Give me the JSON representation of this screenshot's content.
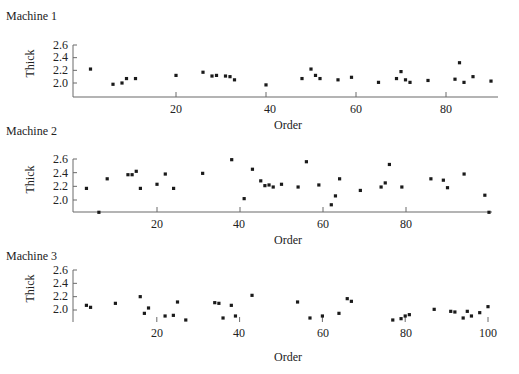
{
  "chart_data": [
    {
      "type": "scatter",
      "title": "Machine 1",
      "xlabel": "Order",
      "ylabel": "Thick",
      "yticks": [
        "2.6",
        "2.4",
        "2.2",
        "2.0"
      ],
      "xticks": [
        "20",
        "40",
        "60",
        "80"
      ],
      "xlim": [
        0,
        91
      ],
      "ylim": [
        1.8,
        2.6
      ],
      "grid": false,
      "points": [
        [
          1,
          2.22
        ],
        [
          6,
          1.98
        ],
        [
          8,
          2.0
        ],
        [
          9,
          2.07
        ],
        [
          11,
          2.07
        ],
        [
          20,
          2.12
        ],
        [
          26,
          2.17
        ],
        [
          28,
          2.11
        ],
        [
          29,
          2.12
        ],
        [
          31,
          2.11
        ],
        [
          32,
          2.1
        ],
        [
          33,
          2.05
        ],
        [
          40,
          1.97
        ],
        [
          48,
          2.07
        ],
        [
          50,
          2.22
        ],
        [
          51,
          2.12
        ],
        [
          52,
          2.07
        ],
        [
          56,
          2.05
        ],
        [
          59,
          2.09
        ],
        [
          65,
          2.01
        ],
        [
          69,
          2.07
        ],
        [
          70,
          2.18
        ],
        [
          71,
          2.05
        ],
        [
          72,
          2.01
        ],
        [
          76,
          2.04
        ],
        [
          82,
          2.06
        ],
        [
          83,
          2.32
        ],
        [
          84,
          2.01
        ],
        [
          86,
          2.1
        ],
        [
          90,
          2.03
        ]
      ]
    },
    {
      "type": "scatter",
      "title": "Machine 2",
      "xlabel": "Order",
      "ylabel": "Thick",
      "yticks": [
        "2.6",
        "2.4",
        "2.2",
        "2.0"
      ],
      "xticks": [
        "20",
        "40",
        "60",
        "80"
      ],
      "xlim": [
        0,
        100
      ],
      "ylim": [
        1.8,
        2.6
      ],
      "grid": false,
      "points": [
        [
          3,
          2.17
        ],
        [
          6,
          1.82
        ],
        [
          8,
          2.31
        ],
        [
          13,
          2.37
        ],
        [
          14,
          2.37
        ],
        [
          15,
          2.42
        ],
        [
          16,
          2.17
        ],
        [
          20,
          2.23
        ],
        [
          22,
          2.38
        ],
        [
          24,
          2.17
        ],
        [
          31,
          2.39
        ],
        [
          38,
          2.59
        ],
        [
          41,
          2.02
        ],
        [
          43,
          2.45
        ],
        [
          45,
          2.28
        ],
        [
          46,
          2.21
        ],
        [
          47,
          2.22
        ],
        [
          48,
          2.19
        ],
        [
          50,
          2.23
        ],
        [
          54,
          2.19
        ],
        [
          56,
          2.56
        ],
        [
          59,
          2.22
        ],
        [
          62,
          1.93
        ],
        [
          63,
          2.06
        ],
        [
          64,
          2.31
        ],
        [
          69,
          2.14
        ],
        [
          74,
          2.19
        ],
        [
          75,
          2.25
        ],
        [
          76,
          2.52
        ],
        [
          79,
          2.19
        ],
        [
          86,
          2.31
        ],
        [
          89,
          2.29
        ],
        [
          90,
          2.18
        ],
        [
          94,
          2.38
        ],
        [
          99,
          2.07
        ],
        [
          100,
          1.82
        ]
      ]
    },
    {
      "type": "scatter",
      "title": "Machine 3",
      "xlabel": "Order",
      "ylabel": "Thick",
      "yticks": [
        "2.6",
        "2.4",
        "2.2",
        "2.0"
      ],
      "xticks": [
        "20",
        "40",
        "60",
        "80",
        "100"
      ],
      "xlim": [
        0,
        100
      ],
      "ylim": [
        1.8,
        2.6
      ],
      "grid": false,
      "points": [
        [
          3,
          2.07
        ],
        [
          4,
          2.04
        ],
        [
          10,
          2.1
        ],
        [
          16,
          2.2
        ],
        [
          17,
          1.95
        ],
        [
          18,
          2.03
        ],
        [
          22,
          1.91
        ],
        [
          24,
          1.92
        ],
        [
          25,
          2.12
        ],
        [
          27,
          1.85
        ],
        [
          34,
          2.11
        ],
        [
          35,
          2.1
        ],
        [
          36,
          1.88
        ],
        [
          38,
          2.07
        ],
        [
          39,
          1.91
        ],
        [
          43,
          2.22
        ],
        [
          54,
          2.12
        ],
        [
          57,
          1.88
        ],
        [
          60,
          1.91
        ],
        [
          64,
          1.95
        ],
        [
          66,
          2.17
        ],
        [
          67,
          2.13
        ],
        [
          77,
          1.85
        ],
        [
          79,
          1.87
        ],
        [
          80,
          1.91
        ],
        [
          81,
          1.93
        ],
        [
          87,
          2.01
        ],
        [
          91,
          1.98
        ],
        [
          92,
          1.97
        ],
        [
          94,
          1.88
        ],
        [
          95,
          1.98
        ],
        [
          96,
          1.91
        ],
        [
          98,
          1.96
        ],
        [
          100,
          2.05
        ]
      ]
    }
  ],
  "layout": [
    {
      "title_pos": [
        6,
        9
      ],
      "ylabel_pos": [
        20,
        62
      ],
      "yaxis_x": 73,
      "y_top": 45,
      "y_bottom": 83,
      "axis_y": 97,
      "x0_px": 86,
      "x_per_unit": 4.5,
      "x_end": 498,
      "xtick_y": 110,
      "xlabel_pos": [
        273,
        120
      ]
    },
    {
      "title_pos": [
        6,
        124
      ],
      "ylabel_pos": [
        20,
        175
      ],
      "yaxis_x": 73,
      "y_top": 159,
      "y_bottom": 200,
      "axis_y": 212,
      "x0_px": 74,
      "x_per_unit": 4.15,
      "x_end": 492,
      "xtick_y": 219,
      "xlabel_pos": [
        273,
        235
      ]
    },
    {
      "title_pos": [
        6,
        249
      ],
      "ylabel_pos": [
        20,
        284
      ],
      "yaxis_x": 73,
      "y_top": 270,
      "y_bottom": 310,
      "axis_y": 322,
      "x0_px": 74,
      "x_per_unit": 4.14,
      "x_end": 488,
      "xtick_y": 328,
      "xlabel_pos": [
        273,
        351
      ]
    }
  ]
}
